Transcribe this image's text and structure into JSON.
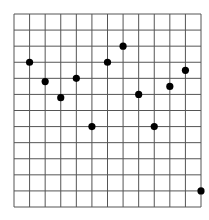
{
  "chart_data": {
    "type": "scatter",
    "title": "",
    "xlabel": "",
    "ylabel": "",
    "grid": true,
    "grid_columns": 12,
    "grid_rows": 12,
    "xlim": [
      0,
      12
    ],
    "ylim": [
      0,
      12
    ],
    "x": [
      1,
      2,
      3,
      4,
      5,
      6,
      7,
      8,
      9,
      10,
      11,
      12
    ],
    "y": [
      9,
      7.8,
      6.8,
      8,
      5,
      9,
      10,
      7,
      5,
      7.5,
      8.5,
      1
    ],
    "point_color": "#000000",
    "grid_color": "#555555"
  },
  "plot": {
    "left": 14,
    "top": 14,
    "width": 187,
    "height": 193
  }
}
